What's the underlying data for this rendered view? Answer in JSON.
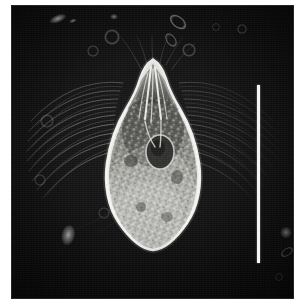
{
  "figure": {
    "domain": "Natural-Image",
    "modality": "phase-contrast light micrograph",
    "caption": "",
    "orientation": "anterior up, posterior down",
    "background_label": "dark phase-contrast field with radiating ciliary streaks"
  },
  "canvas": {
    "width_px": 298,
    "height_px": 308,
    "page_background": "#ffffff"
  },
  "plate": {
    "left_px": 11,
    "top_px": 5,
    "width_px": 283,
    "height_px": 294,
    "background_color": "#080808",
    "mid_tone_color": "#1b1b1b",
    "highlight_color": "#f0f0ee"
  },
  "scale_bar": {
    "present": true,
    "label": "",
    "orientation": "vertical",
    "color": "#f4f4f2",
    "left_px": 246,
    "top_px": 80,
    "length_px": 178,
    "thickness_px": 3
  },
  "organism": {
    "label": "ciliate cell",
    "outline_color": "#e9e9e6",
    "cytoplasm_color": "#9a9a96",
    "bounding_box_px": {
      "x": 86,
      "y": 52,
      "width": 112,
      "height": 198
    },
    "parts": [
      {
        "name": "apical-cone",
        "label": "anterior conical apex"
      },
      {
        "name": "oral-fibrils",
        "label": "bright apical fibrillar bundle"
      },
      {
        "name": "pellicle-outline",
        "label": "bright pellicle border"
      },
      {
        "name": "macronucleus",
        "label": "dark ovoid macronucleus"
      },
      {
        "name": "granular-cytoplasm",
        "label": "granular posterior cytoplasm"
      },
      {
        "name": "ciliary-halo",
        "label": "radiating cilia / striations"
      }
    ]
  },
  "background_particles": [
    {
      "name": "debris-1",
      "cx": 47,
      "cy": 14,
      "rx": 9,
      "ry": 4,
      "rot": -22,
      "brightness": 0.8
    },
    {
      "name": "debris-2",
      "cx": 62,
      "cy": 16,
      "rx": 4,
      "ry": 2,
      "rot": -20,
      "brightness": 0.6
    },
    {
      "name": "debris-3",
      "cx": 103,
      "cy": 12,
      "rx": 4,
      "ry": 3,
      "rot": 0,
      "brightness": 0.55
    },
    {
      "name": "vesicle-1",
      "cx": 101,
      "cy": 32,
      "rx": 8,
      "ry": 8,
      "rot": 0,
      "brightness": 0.35
    },
    {
      "name": "vesicle-2",
      "cx": 82,
      "cy": 46,
      "rx": 6,
      "ry": 6,
      "rot": 0,
      "brightness": 0.3
    },
    {
      "name": "debris-4",
      "cx": 167,
      "cy": 17,
      "rx": 10,
      "ry": 6,
      "rot": 38,
      "brightness": 0.75
    },
    {
      "name": "debris-5",
      "cx": 160,
      "cy": 35,
      "rx": 8,
      "ry": 5,
      "rot": 55,
      "brightness": 0.6
    },
    {
      "name": "vesicle-3",
      "cx": 178,
      "cy": 45,
      "rx": 7,
      "ry": 7,
      "rot": 0,
      "brightness": 0.38
    },
    {
      "name": "vesicle-4",
      "cx": 231,
      "cy": 24,
      "rx": 5,
      "ry": 5,
      "rot": 0,
      "brightness": 0.45
    },
    {
      "name": "vesicle-5",
      "cx": 36,
      "cy": 116,
      "rx": 7,
      "ry": 7,
      "rot": 0,
      "brightness": 0.32
    },
    {
      "name": "vesicle-6",
      "cx": 29,
      "cy": 175,
      "rx": 6,
      "ry": 6,
      "rot": 0,
      "brightness": 0.3
    },
    {
      "name": "debris-6",
      "cx": 57,
      "cy": 231,
      "rx": 7,
      "ry": 11,
      "rot": 12,
      "brightness": 0.72
    },
    {
      "name": "vesicle-7",
      "cx": 93,
      "cy": 208,
      "rx": 6,
      "ry": 6,
      "rot": 0,
      "brightness": 0.28
    },
    {
      "name": "vesicle-8",
      "cx": 275,
      "cy": 228,
      "rx": 6,
      "ry": 6,
      "rot": 0,
      "brightness": 0.5
    },
    {
      "name": "debris-7",
      "cx": 276,
      "cy": 247,
      "rx": 7,
      "ry": 4,
      "rot": -35,
      "brightness": 0.55
    },
    {
      "name": "vesicle-9",
      "cx": 268,
      "cy": 272,
      "rx": 4,
      "ry": 4,
      "rot": 0,
      "brightness": 0.35
    },
    {
      "name": "vesicle-10",
      "cx": 205,
      "cy": 22,
      "rx": 4,
      "ry": 4,
      "rot": 0,
      "brightness": 0.3
    }
  ],
  "accessibility": {
    "alt_text": "Dark-field phase-contrast micrograph of a pear-shaped ciliate protozoan with a pointed anterior end, bright pellicle outline, dark ovoid macronucleus and densely granular posterior cytoplasm, surrounded by a halo of radiating cilia; a vertical white scale bar is at the right."
  }
}
